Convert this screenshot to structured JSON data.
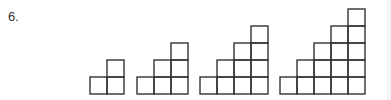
{
  "problem": {
    "number_label": "6.",
    "staircases": [
      {
        "steps": 2
      },
      {
        "steps": 3
      },
      {
        "steps": 4
      },
      {
        "steps": 5
      }
    ],
    "line_color": "#333333"
  }
}
